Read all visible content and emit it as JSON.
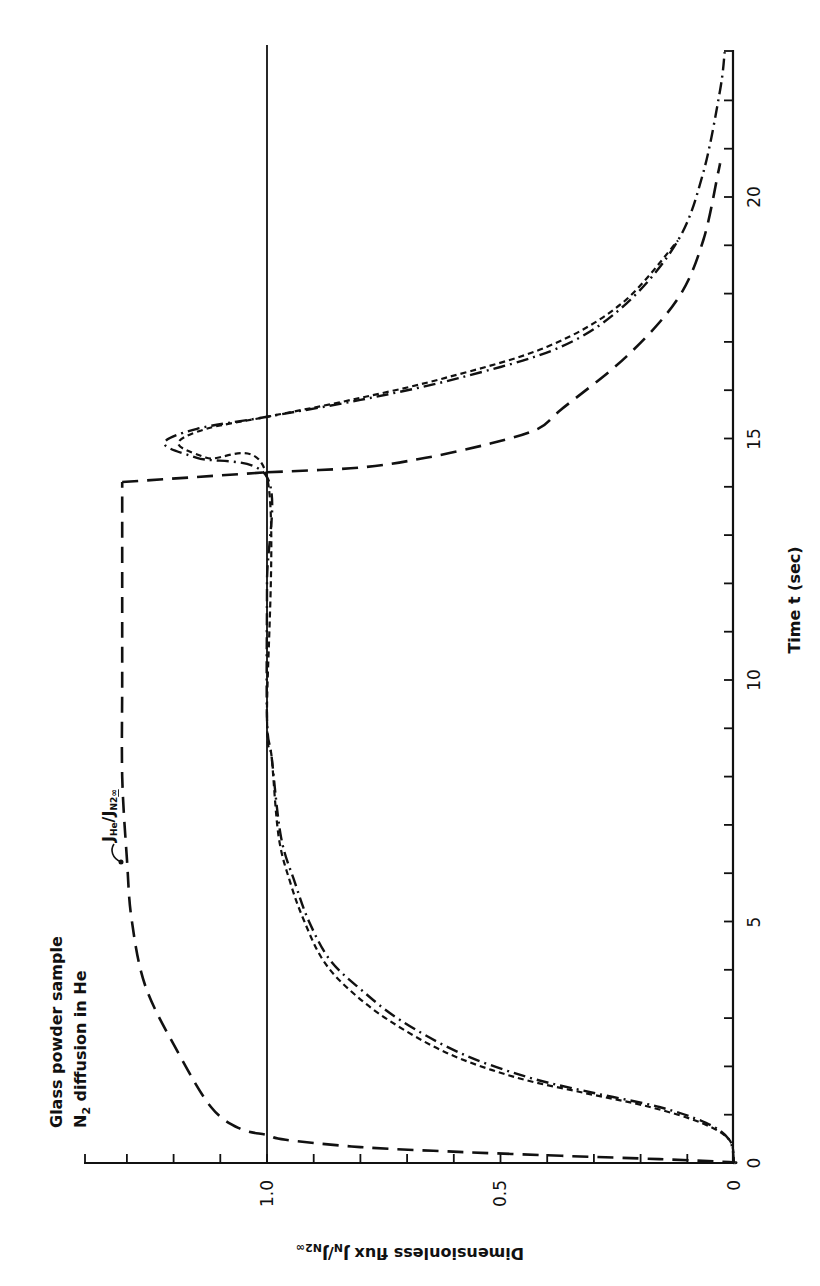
{
  "figure": {
    "annotation_line1": "Glass powder sample",
    "annotation_line2_prefix": "N",
    "annotation_line2_sub": "2",
    "annotation_line2_suffix": " diffusion in He",
    "he_label": "J",
    "he_label_sub": "He",
    "he_label_mid": "/J",
    "he_label_sub2": "N2",
    "he_label_sub3": "∞",
    "x_axis_title": "Time t (sec)",
    "y_axis_title_main": "Dimensionless flux J",
    "y_axis_title_sub1": "N",
    "y_axis_title_mid": "/J",
    "y_axis_title_sub2": "N2",
    "y_axis_title_sub3": "∞",
    "time_ticks": [
      "0",
      "5",
      "10",
      "15",
      "20"
    ],
    "flux_ticks": [
      "0",
      "0.5",
      "1.0"
    ],
    "origin_label": "0"
  },
  "chart_data": {
    "type": "line",
    "xlabel": "Time t (sec)",
    "ylabel": "Dimensionless flux J_N/J_N2∞",
    "xlim": [
      0,
      23
    ],
    "ylim": [
      0,
      1.39
    ],
    "x_ticks": [
      0,
      5,
      10,
      15,
      20
    ],
    "y_ticks": [
      0,
      0.5,
      1.0
    ],
    "orientation": "figure rotated 90° counter-clockwise (time axis vertical on right, flux axis horizontal along bottom)",
    "grid": false,
    "reference_line": {
      "y": 1.0,
      "style": "solid"
    },
    "series": [
      {
        "name": "J_He/J_N2∞",
        "style": "long dash",
        "x": [
          0,
          0.02,
          0.08,
          0.15,
          0.23,
          0.33,
          0.48,
          0.58,
          0.72,
          1.16,
          2.28,
          3.65,
          5.05,
          6.3,
          8.0,
          10.0,
          12.0,
          14.1,
          14.3,
          14.4,
          14.6,
          14.9,
          15.2,
          15.6,
          16.7,
          17.9,
          19.1,
          20.5,
          20.7
        ],
        "values": [
          0,
          0.01,
          0.16,
          0.37,
          0.59,
          0.8,
          0.96,
          1.0,
          1.06,
          1.12,
          1.19,
          1.26,
          1.29,
          1.3,
          1.31,
          1.31,
          1.31,
          1.31,
          1.0,
          0.8,
          0.66,
          0.52,
          0.42,
          0.37,
          0.23,
          0.12,
          0.066,
          0.034,
          0.03
        ]
      },
      {
        "name": "N2 flux (dash-dot)",
        "style": "dash-dot",
        "x": [
          0,
          0.48,
          0.83,
          1.16,
          1.45,
          1.78,
          2.28,
          2.96,
          3.6,
          4.2,
          5.0,
          5.8,
          6.75,
          8.4,
          9.2,
          12.0,
          14.2,
          14.6,
          14.9,
          15.2,
          15.45,
          15.8,
          16.25,
          16.9,
          17.8,
          19.1,
          20.5,
          22.2,
          23.0
        ],
        "values": [
          0,
          0.01,
          0.06,
          0.16,
          0.3,
          0.443,
          0.587,
          0.715,
          0.8,
          0.865,
          0.91,
          0.94,
          0.97,
          0.99,
          1.0,
          1.0,
          1.0,
          1.15,
          1.22,
          1.15,
          1.0,
          0.8,
          0.59,
          0.37,
          0.23,
          0.12,
          0.066,
          0.03,
          0.02
        ]
      },
      {
        "name": "N2 flux (short dash)",
        "style": "short dash",
        "x": [
          0,
          0.48,
          0.83,
          1.16,
          1.45,
          1.78,
          2.28,
          2.96,
          3.6,
          4.2,
          5.0,
          5.8,
          6.75,
          8.4,
          9.2,
          14.2,
          14.6,
          14.9,
          15.2,
          15.45,
          15.8,
          16.25,
          16.9,
          17.8,
          19.1
        ],
        "values": [
          0,
          0.01,
          0.07,
          0.18,
          0.32,
          0.47,
          0.615,
          0.74,
          0.825,
          0.88,
          0.92,
          0.95,
          0.975,
          0.99,
          1.0,
          1.0,
          1.13,
          1.19,
          1.13,
          1.0,
          0.82,
          0.62,
          0.4,
          0.24,
          0.12
        ]
      }
    ],
    "annotations": [
      "Glass powder sample",
      "N2 diffusion in He",
      "J_He/J_N2∞"
    ]
  }
}
